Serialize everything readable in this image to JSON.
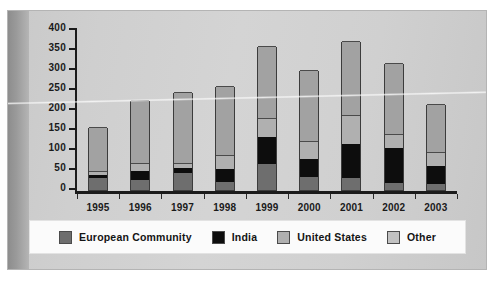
{
  "chart_data": {
    "type": "bar",
    "stacked": true,
    "title": "",
    "subtitle": "",
    "xlabel": "",
    "ylabel": "",
    "ylim": [
      0,
      400
    ],
    "yticks": [
      0,
      50,
      100,
      150,
      200,
      250,
      300,
      350,
      400
    ],
    "grid": false,
    "legend_position": "bottom",
    "categories": [
      "1995",
      "1996",
      "1997",
      "1998",
      "1999",
      "2000",
      "2001",
      "2002",
      "2003"
    ],
    "series": [
      {
        "name": "European Community",
        "color": "#6e6e6e",
        "values": [
          30,
          25,
          42,
          20,
          65,
          32,
          30,
          18,
          14
        ]
      },
      {
        "name": "India",
        "color": "#0d0d0d",
        "values": [
          38,
          47,
          55,
          52,
          132,
          77,
          114,
          106,
          59
        ]
      },
      {
        "name": "United States",
        "color": "#b0b0b0",
        "values": [
          48,
          68,
          67,
          87,
          180,
          122,
          188,
          140,
          96
        ]
      },
      {
        "name": "Other",
        "color": "#a2a2a2",
        "values": [
          157,
          226,
          245,
          260,
          360,
          299,
          373,
          317,
          216
        ]
      }
    ],
    "cumulative_note": "series values are cumulative stack tops read off the axis",
    "totals": [
      157,
      226,
      245,
      260,
      360,
      299,
      373,
      317,
      216
    ]
  },
  "legend": {
    "items": [
      {
        "label": "European Community",
        "swatch": "ec"
      },
      {
        "label": "India",
        "swatch": "india"
      },
      {
        "label": "United States",
        "swatch": "us"
      },
      {
        "label": "Other",
        "swatch": "other"
      }
    ]
  },
  "colors": {
    "european_community": "#6e6e6e",
    "india": "#0d0d0d",
    "united_states": "#b0b0b0",
    "other": "#a2a2a2",
    "axis": "#1b1b1b",
    "page_background": "#d0d0d0",
    "legend_background": "#fbfbfb"
  }
}
